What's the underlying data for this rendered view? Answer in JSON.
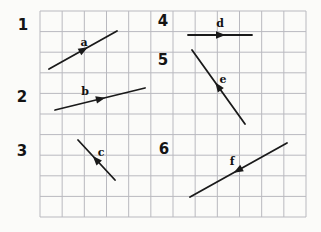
{
  "figure": {
    "background_color": "#fbfbf9",
    "vector_color": "#1a1a1a",
    "grid": {
      "left": 40,
      "top": 11,
      "right": 306,
      "bottom": 217,
      "cols": 12,
      "rows": 10,
      "line_color": "#b9b9bf"
    },
    "numbers": [
      {
        "text": "1",
        "x": 23,
        "y": 30
      },
      {
        "text": "2",
        "x": 22,
        "y": 102
      },
      {
        "text": "3",
        "x": 22,
        "y": 156
      },
      {
        "text": "4",
        "x": 163,
        "y": 26
      },
      {
        "text": "5",
        "x": 163,
        "y": 65
      },
      {
        "text": "6",
        "x": 164,
        "y": 154
      }
    ],
    "vectors": [
      {
        "label": "a",
        "x1": 49,
        "y1": 69,
        "x2": 117,
        "y2": 31,
        "arrow_dir": "forward",
        "label_x": 84,
        "label_y": 46
      },
      {
        "label": "b",
        "x1": 55,
        "y1": 110,
        "x2": 145,
        "y2": 88,
        "arrow_dir": "forward",
        "label_x": 85,
        "label_y": 95
      },
      {
        "label": "c",
        "x1": 78,
        "y1": 140,
        "x2": 115,
        "y2": 180,
        "arrow_dir": "backward",
        "label_x": 101,
        "label_y": 156
      },
      {
        "label": "d",
        "x1": 188,
        "y1": 35,
        "x2": 252,
        "y2": 35,
        "arrow_dir": "forward",
        "label_x": 220,
        "label_y": 27
      },
      {
        "label": "e",
        "x1": 192,
        "y1": 50,
        "x2": 245,
        "y2": 124,
        "arrow_dir": "backward",
        "label_x": 223,
        "label_y": 83
      },
      {
        "label": "f",
        "x1": 190,
        "y1": 197,
        "x2": 287,
        "y2": 143,
        "arrow_dir": "backward",
        "label_x": 232,
        "label_y": 165
      }
    ]
  }
}
